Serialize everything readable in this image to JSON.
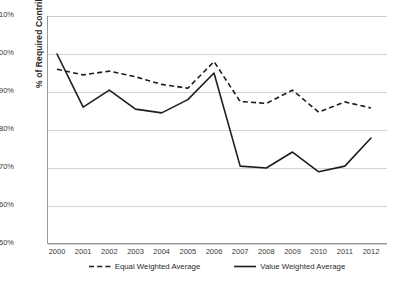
{
  "chart_data": {
    "type": "line",
    "title": "",
    "xlabel": "",
    "ylabel": "% of Required Contributions",
    "categories": [
      "2000",
      "2001",
      "2002",
      "2003",
      "2004",
      "2005",
      "2006",
      "2007",
      "2008",
      "2009",
      "2010",
      "2011",
      "2012"
    ],
    "ylim": [
      50,
      110
    ],
    "ytick_labels": [
      "110%",
      "100%",
      "90%",
      "80%",
      "70%",
      "60%",
      "50%"
    ],
    "ytick_values": [
      110,
      100,
      90,
      80,
      70,
      60,
      50
    ],
    "grid": "horizontal",
    "legend_position": "bottom",
    "series": [
      {
        "name": "Equal Weighted Average",
        "style": "dashed",
        "values": [
          96.0,
          94.5,
          95.5,
          94.0,
          92.0,
          91.0,
          98.0,
          87.5,
          87.0,
          90.5,
          84.7,
          87.4,
          85.8
        ]
      },
      {
        "name": "Value Weighted Average",
        "style": "solid",
        "values": [
          100.0,
          86.0,
          90.5,
          85.5,
          84.5,
          88.0,
          95.0,
          70.5,
          70.0,
          74.2,
          69.0,
          70.5,
          77.9
        ]
      }
    ]
  },
  "legend": {
    "items": [
      {
        "label": "Equal Weighted Average",
        "style": "dashed"
      },
      {
        "label": "Value Weighted Average",
        "style": "solid"
      }
    ]
  }
}
